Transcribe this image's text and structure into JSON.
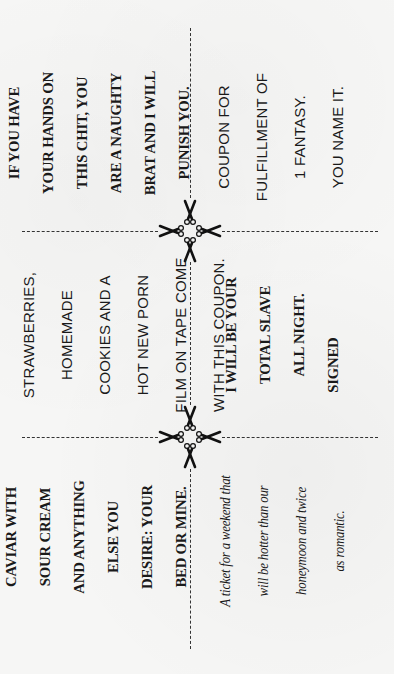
{
  "coupons": [
    {
      "id": "punish",
      "style": "serif-bold",
      "lines": [
        "IF YOU HAVE",
        "YOUR HANDS ON",
        "THIS CHIT, YOU",
        "ARE A NAUGHTY",
        "BRAT AND I WILL",
        "PUNISH YOU."
      ]
    },
    {
      "id": "fantasy",
      "style": "sans",
      "lines": [
        "COUPON FOR",
        "FULFILLMENT OF",
        "1 FANTASY.",
        "YOU NAME IT."
      ]
    },
    {
      "id": "champagne",
      "style": "sans",
      "lines": [
        "CHAMPAGNE,",
        "STRAWBERRIES,",
        "HOMEMADE",
        "COOKIES AND A",
        "HOT NEW PORN",
        "FILM ON TAPE COME",
        "WITH THIS COUPON."
      ]
    },
    {
      "id": "slave",
      "style": "serif-bold",
      "lines": [
        "I WILL BE YOUR",
        "TOTAL SLAVE",
        "ALL NIGHT.",
        "SIGNED"
      ]
    },
    {
      "id": "caviar",
      "style": "serif-bold",
      "lines": [
        "CAVIAR WITH",
        "SOUR CREAM",
        "AND ANYTHING",
        "ELSE YOU",
        "DESIRE: YOUR",
        "BED OR MINE."
      ]
    },
    {
      "id": "ticket",
      "style": "italic",
      "lines": [
        "A ticket for a weekend that",
        "will be hotter than our",
        "honeymoon and twice",
        "as romantic."
      ]
    }
  ],
  "icons": {
    "cut_marks": "scissors-icon"
  },
  "colors": {
    "paper": "#f6f6f5",
    "ink": "#1a1a1a"
  }
}
